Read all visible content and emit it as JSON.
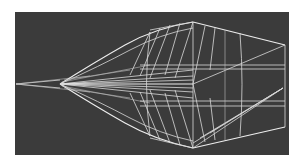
{
  "figure": {
    "colors": {
      "background": "#ffffff",
      "panel": "#3b3b3b",
      "wire": "#d8d8d8"
    },
    "panel_bounds": {
      "x": 15,
      "y": 12,
      "width": 274,
      "height": 143
    },
    "key_points": {
      "nose_tip": [
        16,
        84
      ],
      "inner_nose": [
        60,
        84
      ],
      "top_apex": [
        193,
        22
      ],
      "bottom_apex": [
        193,
        148
      ],
      "center": [
        193,
        84
      ],
      "tail_top": [
        285,
        45
      ],
      "tail_bottom": [
        285,
        127
      ],
      "tail_mid": [
        283,
        88
      ]
    }
  }
}
